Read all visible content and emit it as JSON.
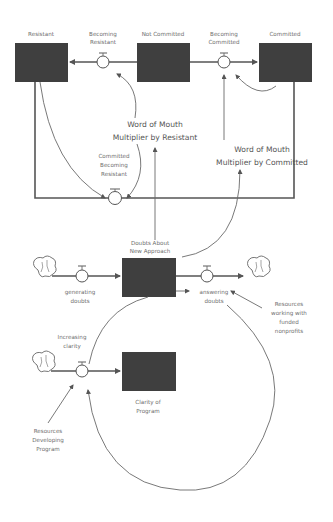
{
  "diagram": {
    "type": "stock-and-flow",
    "stocks": {
      "resistant": "Resistant",
      "not_committed": "Not Committed",
      "committed": "Committed",
      "doubts": [
        "Doubts About",
        "New Approach"
      ],
      "clarity": [
        "Clarity of",
        "Program"
      ]
    },
    "flows": {
      "becoming_resistant": [
        "Becoming",
        "Resistant"
      ],
      "becoming_committed": [
        "Becoming",
        "Committed"
      ],
      "committed_becoming_resistant": [
        "Committed",
        "Becoming",
        "Resistant"
      ],
      "generating_doubts": [
        "generating",
        "doubts"
      ],
      "answering_doubts": [
        "answering",
        "doubts"
      ],
      "increasing_clarity": [
        "Increasing",
        "clarity"
      ]
    },
    "auxiliaries": {
      "wom_resistant": [
        "Word of Mouth",
        "Multiplier by Resistant"
      ],
      "wom_committed": [
        "Word of Mouth",
        "Multiplier by Committed"
      ],
      "resources_nonprofits": [
        "Resources",
        "working with",
        "funded",
        "nonprofits"
      ],
      "resources_developing": [
        "Resources",
        "Developing",
        "Program"
      ]
    },
    "colors": {
      "stock": "#3f3f3f",
      "line": "#555555",
      "text": "#6e6e6e"
    }
  }
}
